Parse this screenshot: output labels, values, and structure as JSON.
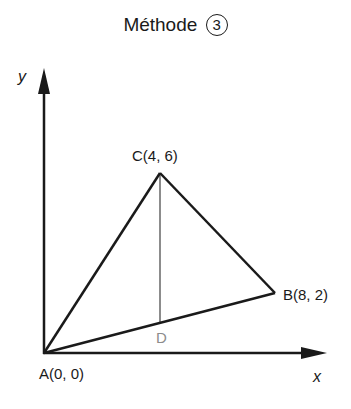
{
  "title": {
    "text": "Méthode",
    "circled_number": "3"
  },
  "axes": {
    "x_label": "x",
    "y_label": "y"
  },
  "points": {
    "A": {
      "label": "A(0, 0)",
      "x": 0,
      "y": 0
    },
    "B": {
      "label": "B(8, 2)",
      "x": 8,
      "y": 2
    },
    "C": {
      "label": "C(4, 6)",
      "x": 4,
      "y": 6
    },
    "D": {
      "label": "D",
      "x": 4,
      "y": 1
    }
  },
  "segments": [
    {
      "from": "A",
      "to": "C",
      "color": "#1a1a1a"
    },
    {
      "from": "C",
      "to": "B",
      "color": "#1a1a1a"
    },
    {
      "from": "A",
      "to": "B",
      "color": "#1a1a1a"
    },
    {
      "from": "C",
      "to": "D",
      "color": "#8c8c8c"
    }
  ],
  "colors": {
    "main": "#1a1a1a",
    "auxiliary": "#8c8c8c"
  }
}
